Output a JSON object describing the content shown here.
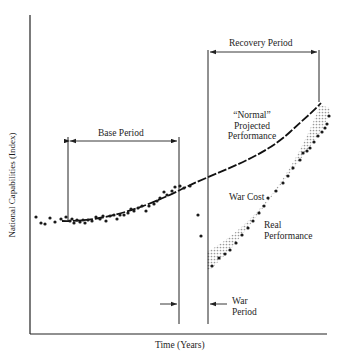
{
  "chart_data": {
    "type": "scatter",
    "title": "",
    "xlabel": "Time (Years)",
    "ylabel": "National Capabilities (Index)",
    "grid": false,
    "legend": "none",
    "annotations": [
      {
        "text": "Base Period",
        "kind": "bracket"
      },
      {
        "text": "Recovery Period",
        "kind": "bracket"
      },
      {
        "text": "War Period",
        "kind": "arrow-bracket"
      },
      {
        "text": "“Normal” Projected Performance",
        "kind": "curve-label"
      },
      {
        "text": "War Cost",
        "kind": "shaded-region-label"
      },
      {
        "text": "Real Performance",
        "kind": "point-series-label"
      }
    ],
    "series": [
      {
        "name": "Observed capabilities (pre-war)",
        "points": [
          [
            36,
            217
          ],
          [
            41,
            223
          ],
          [
            45,
            224
          ],
          [
            50,
            218
          ],
          [
            55,
            222
          ],
          [
            61,
            219
          ],
          [
            66,
            217
          ],
          [
            70,
            221
          ],
          [
            72,
            219
          ],
          [
            74,
            223
          ],
          [
            77,
            220
          ],
          [
            80,
            222
          ],
          [
            83,
            220
          ],
          [
            85,
            223
          ],
          [
            88,
            220
          ],
          [
            92,
            221
          ],
          [
            96,
            217
          ],
          [
            100,
            219
          ],
          [
            103,
            216
          ],
          [
            106,
            221
          ],
          [
            110,
            216
          ],
          [
            114,
            215
          ],
          [
            117,
            219
          ],
          [
            120,
            215
          ],
          [
            124,
            215
          ],
          [
            128,
            213
          ],
          [
            131,
            209
          ],
          [
            134,
            211
          ],
          [
            138,
            208
          ],
          [
            142,
            206
          ],
          [
            146,
            211
          ],
          [
            149,
            206
          ],
          [
            154,
            204
          ],
          [
            157,
            201
          ],
          [
            160,
            198
          ],
          [
            164,
            192
          ],
          [
            167,
            195
          ],
          [
            172,
            191
          ],
          [
            175,
            187
          ],
          [
            180,
            186
          ],
          [
            184,
            188
          ],
          [
            190,
            186
          ]
        ]
      },
      {
        "name": "War period decline",
        "points": [
          [
            198,
            215
          ],
          [
            201,
            236
          ]
        ]
      },
      {
        "name": "Real Performance",
        "points": [
          [
            212,
            266
          ],
          [
            219,
            258
          ],
          [
            225,
            254
          ],
          [
            230,
            250
          ],
          [
            236,
            243
          ],
          [
            242,
            235
          ],
          [
            248,
            228
          ],
          [
            253,
            221
          ],
          [
            259,
            213
          ],
          [
            264,
            206
          ],
          [
            268,
            198
          ],
          [
            276,
            191
          ],
          [
            283,
            183
          ],
          [
            288,
            176
          ],
          [
            293,
            168
          ],
          [
            300,
            160
          ],
          [
            303,
            153
          ],
          [
            307,
            151
          ],
          [
            310,
            148
          ],
          [
            314,
            142
          ],
          [
            318,
            136
          ],
          [
            322,
            132
          ],
          [
            325,
            128
          ],
          [
            327,
            124
          ],
          [
            329,
            116
          ]
        ]
      },
      {
        "name": "“Normal” Projected Performance",
        "kind": "curve"
      }
    ]
  },
  "labels": {
    "base_period": "Base Period",
    "recovery_period": "Recovery Period",
    "normal_q": "“Normal”",
    "projected": "Projected",
    "performance1": "Performance",
    "war_cost": "War Cost",
    "real": "Real",
    "performance2": "Performance",
    "war": "War",
    "period": "Period",
    "xlabel": "Time (Years)",
    "ylabel": "National Capabilities (Index)"
  },
  "colors": {
    "ink": "#1a1a1a",
    "shade": "#bdbdbd",
    "background": "#ffffff"
  }
}
